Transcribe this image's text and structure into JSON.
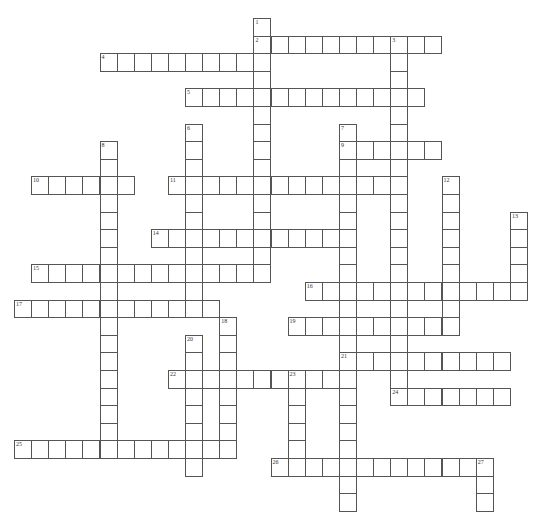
{
  "puzzle": {
    "type": "crossword",
    "grid": {
      "origin_x": 14,
      "origin_y": 18,
      "cell_w": 17.1,
      "cell_h": 17.6
    },
    "colors": {
      "border": "#555555",
      "cell_bg": "#ffffff",
      "number": "#333333"
    },
    "across": [
      {
        "number": "2",
        "row": 1,
        "col": 14,
        "length": 11
      },
      {
        "number": "4",
        "row": 2,
        "col": 5,
        "length": 10
      },
      {
        "number": "5",
        "row": 4,
        "col": 10,
        "length": 14
      },
      {
        "number": "9",
        "row": 7,
        "col": 19,
        "length": 6
      },
      {
        "number": "10",
        "row": 9,
        "col": 1,
        "length": 6
      },
      {
        "number": "11",
        "row": 9,
        "col": 9,
        "length": 14
      },
      {
        "number": "14",
        "row": 12,
        "col": 8,
        "length": 12
      },
      {
        "number": "15",
        "row": 14,
        "col": 1,
        "length": 14
      },
      {
        "number": "16",
        "row": 15,
        "col": 17,
        "length": 13
      },
      {
        "number": "17",
        "row": 16,
        "col": 0,
        "length": 12
      },
      {
        "number": "19",
        "row": 17,
        "col": 16,
        "length": 10
      },
      {
        "number": "21",
        "row": 19,
        "col": 19,
        "length": 10
      },
      {
        "number": "22",
        "row": 20,
        "col": 9,
        "length": 11
      },
      {
        "number": "24",
        "row": 21,
        "col": 22,
        "length": 7
      },
      {
        "number": "25",
        "row": 24,
        "col": 0,
        "length": 13
      },
      {
        "number": "26",
        "row": 25,
        "col": 15,
        "length": 12
      }
    ],
    "down": [
      {
        "number": "1",
        "row": 0,
        "col": 14,
        "length": 15
      },
      {
        "number": "3",
        "row": 1,
        "col": 22,
        "length": 21
      },
      {
        "number": "6",
        "row": 6,
        "col": 10,
        "length": 11
      },
      {
        "number": "7",
        "row": 6,
        "col": 19,
        "length": 22
      },
      {
        "number": "8",
        "row": 7,
        "col": 5,
        "length": 17
      },
      {
        "number": "12",
        "row": 9,
        "col": 25,
        "length": 9
      },
      {
        "number": "13",
        "row": 11,
        "col": 29,
        "length": 5
      },
      {
        "number": "18",
        "row": 17,
        "col": 12,
        "length": 7
      },
      {
        "number": "20",
        "row": 18,
        "col": 10,
        "length": 8
      },
      {
        "number": "23",
        "row": 20,
        "col": 16,
        "length": 6
      },
      {
        "number": "27",
        "row": 25,
        "col": 27,
        "length": 3
      }
    ]
  }
}
